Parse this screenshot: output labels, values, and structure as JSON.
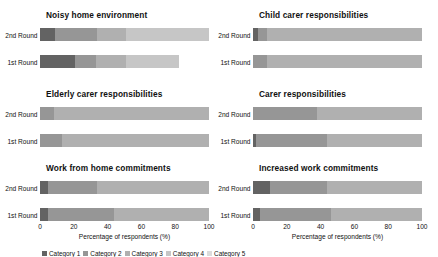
{
  "figure": {
    "axis_title": "Percentage of respondents (%)",
    "x_ticks": [
      "0",
      "20",
      "40",
      "60",
      "80",
      "100"
    ],
    "x_tick_values": [
      0,
      20,
      40,
      60,
      80,
      100
    ],
    "row_labels": [
      "2nd Round",
      "1st Round"
    ],
    "legend_label": "Legend",
    "legend_cut_off": true
  },
  "palette": {
    "cat1": "#636363",
    "cat2": "#969696",
    "cat3": "#b0b0b0",
    "cat4": "#c6c6c6",
    "cat5": "#dcdcdc"
  },
  "chart_data": {
    "type": "bar",
    "orientation": "horizontal",
    "stacked": true,
    "xlabel": "Percentage of respondents (%)",
    "ylabel": "",
    "xlim": [
      0,
      100
    ],
    "grid": false,
    "legend_position": "bottom",
    "categories": [
      "2nd Round",
      "1st Round"
    ],
    "series": [
      {
        "name": "Category 1",
        "color": "#636363"
      },
      {
        "name": "Category 2",
        "color": "#969696"
      },
      {
        "name": "Category 3",
        "color": "#b0b0b0"
      },
      {
        "name": "Category 4",
        "color": "#c6c6c6"
      },
      {
        "name": "Category 5",
        "color": "#dcdcdc"
      }
    ],
    "panels": [
      {
        "title": "Noisy home environment",
        "row": 0,
        "col": 0,
        "bars": [
          {
            "label": "2nd Round",
            "segments": [
              9,
              25,
              17,
              49,
              0
            ],
            "total": 100
          },
          {
            "label": "1st Round",
            "segments": [
              21,
              12,
              18,
              31,
              0
            ],
            "total": 82
          }
        ]
      },
      {
        "title": "Child carer responsibilities",
        "row": 0,
        "col": 1,
        "bars": [
          {
            "label": "2nd Round",
            "segments": [
              3,
              5,
              92,
              0,
              0
            ],
            "total": 100
          },
          {
            "label": "1st Round",
            "segments": [
              0,
              8,
              92,
              0,
              0
            ],
            "total": 100
          }
        ]
      },
      {
        "title": "Elderly carer responsibilities",
        "row": 1,
        "col": 0,
        "bars": [
          {
            "label": "2nd Round",
            "segments": [
              0,
              8,
              92,
              0,
              0
            ],
            "total": 100
          },
          {
            "label": "1st Round",
            "segments": [
              0,
              13,
              87,
              0,
              0
            ],
            "total": 100
          }
        ]
      },
      {
        "title": "Carer responsibilities",
        "row": 1,
        "col": 1,
        "bars": [
          {
            "label": "2nd Round",
            "segments": [
              0,
              38,
              62,
              0,
              0
            ],
            "total": 100
          },
          {
            "label": "1st Round",
            "segments": [
              2,
              42,
              56,
              0,
              0
            ],
            "total": 100
          }
        ]
      },
      {
        "title": "Work from home commitments",
        "row": 2,
        "col": 0,
        "bars": [
          {
            "label": "2nd Round",
            "segments": [
              5,
              29,
              66,
              0,
              0
            ],
            "total": 100
          },
          {
            "label": "1st Round",
            "segments": [
              5,
              39,
              56,
              0,
              0
            ],
            "total": 100
          }
        ]
      },
      {
        "title": "Increased work commitments",
        "row": 2,
        "col": 1,
        "bars": [
          {
            "label": "2nd Round",
            "segments": [
              10,
              34,
              56,
              0,
              0
            ],
            "total": 100
          },
          {
            "label": "1st Round",
            "segments": [
              4,
              42,
              54,
              0,
              0
            ],
            "total": 100
          }
        ]
      }
    ]
  }
}
